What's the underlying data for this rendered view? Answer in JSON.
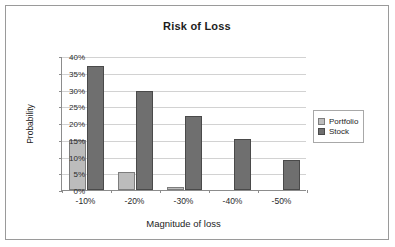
{
  "chart_data": {
    "type": "bar",
    "title": "Risk of Loss",
    "xlabel": "Magnitude of loss",
    "ylabel": "Probability",
    "categories": [
      "-10%",
      "-20%",
      "-30%",
      "-40%",
      "-50%"
    ],
    "series": [
      {
        "name": "Portfolio",
        "color": "#bcbcbc",
        "values": [
          15,
          5.5,
          1,
          0,
          0
        ]
      },
      {
        "name": "Stock",
        "color": "#6f6f6f",
        "values": [
          37,
          29.5,
          22,
          15.2,
          9
        ]
      }
    ],
    "ylim": [
      0,
      40
    ],
    "ytick_values": [
      0,
      5,
      10,
      15,
      20,
      25,
      30,
      35,
      40
    ],
    "ytick_labels": [
      "0%",
      "5%",
      "10%",
      "15%",
      "20%",
      "25%",
      "30%",
      "35%",
      "40%"
    ],
    "grid": true,
    "legend_position": "right",
    "value_suffix": "%"
  },
  "legend": {
    "entries": [
      {
        "label": "Portfolio",
        "swatch": "portfolio"
      },
      {
        "label": "Stock",
        "swatch": "stock"
      }
    ]
  }
}
